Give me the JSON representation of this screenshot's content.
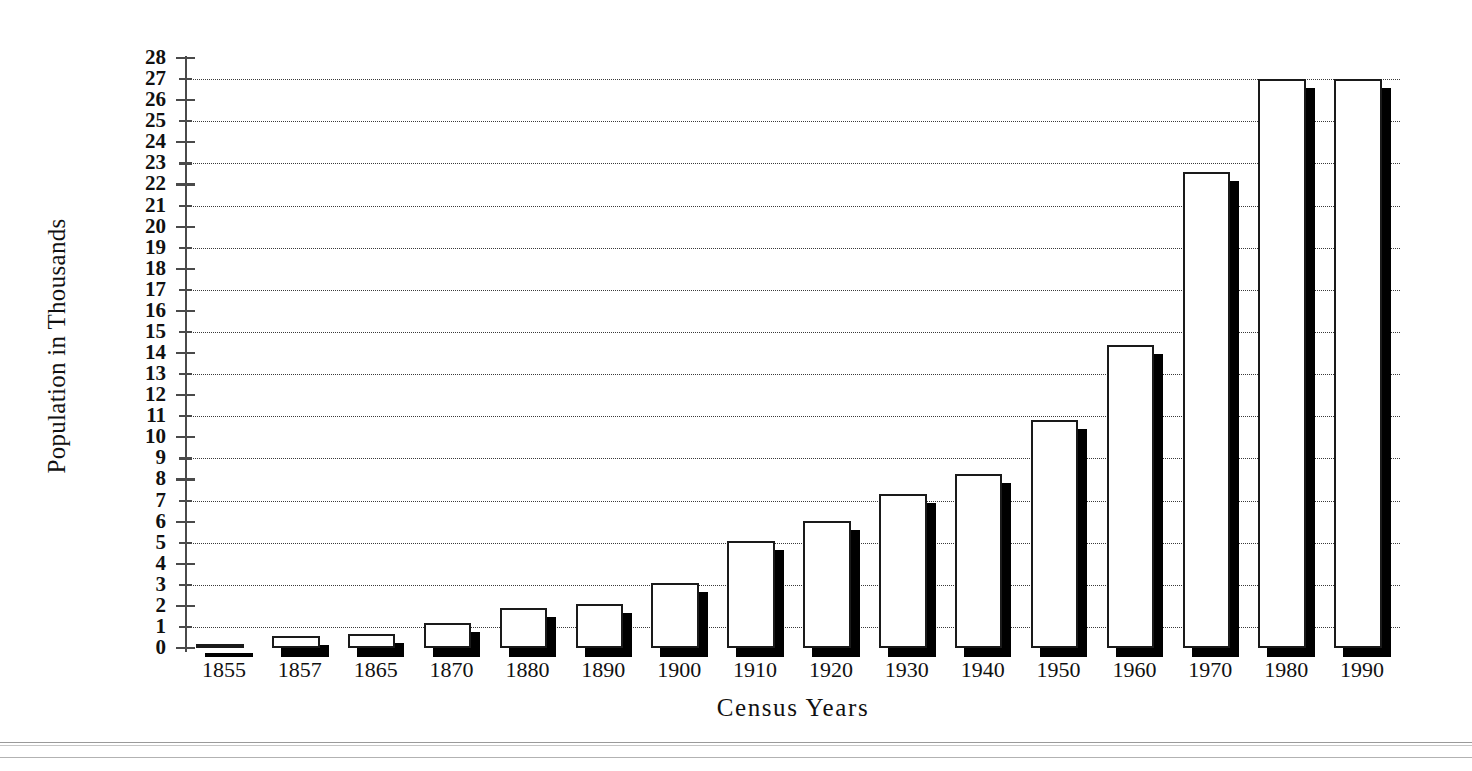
{
  "chart_data": {
    "type": "bar",
    "title": "",
    "xlabel": "Census Years",
    "ylabel": "Population in Thousands",
    "categories": [
      "1855",
      "1857",
      "1865",
      "1870",
      "1880",
      "1890",
      "1900",
      "1910",
      "1920",
      "1930",
      "1940",
      "1950",
      "1960",
      "1970",
      "1980",
      "1990"
    ],
    "values": [
      0.2,
      0.55,
      0.65,
      1.2,
      1.9,
      2.1,
      3.1,
      5.1,
      6.05,
      7.3,
      8.25,
      10.8,
      14.4,
      22.6,
      27.0,
      27.0
    ],
    "ylim": [
      0,
      28
    ],
    "ytick_labels": [
      "0",
      "1",
      "2",
      "3",
      "4",
      "5",
      "6",
      "7",
      "8",
      "9",
      "10",
      "11",
      "12",
      "13",
      "14",
      "15",
      "16",
      "17",
      "18",
      "19",
      "20",
      "21",
      "22",
      "23",
      "24",
      "25",
      "26",
      "27",
      "28"
    ],
    "ytick_step": 1,
    "gridline_values": [
      1,
      3,
      5,
      7,
      9,
      11,
      13,
      15,
      17,
      19,
      21,
      23,
      25,
      27
    ],
    "grid": true,
    "legend": "none",
    "bar_style": "3d-shadow-white-fill",
    "colors": {
      "bar_face": "#ffffff",
      "bar_edge": "#1a1a1a",
      "bar_shadow": "#000000",
      "gridline": "#2a2a2a",
      "axis": "#4a4a4a",
      "background": "#ffffff",
      "text": "#111111"
    }
  }
}
